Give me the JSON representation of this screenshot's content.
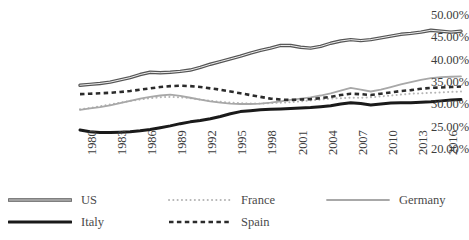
{
  "chart_data": {
    "type": "line",
    "title": "",
    "subtitle": "",
    "xlabel": "",
    "ylabel": "",
    "grid": false,
    "legend_position": "bottom",
    "xlim": [
      1980,
      2018
    ],
    "ylim": [
      0.2,
      0.5
    ],
    "ytick_labels": [
      "50.00%",
      "45.00%",
      "40.00%",
      "35.00%",
      "30.00%",
      "25.00%",
      "20.00%"
    ],
    "ytick_values": [
      0.5,
      0.45,
      0.4,
      0.35,
      0.3,
      0.25,
      0.2
    ],
    "xtick_labels": [
      "1980",
      "1983",
      "1986",
      "1989",
      "1992",
      "1995",
      "1998",
      "2001",
      "2004",
      "2007",
      "2010",
      "2013",
      "2016"
    ],
    "xtick_values": [
      1980,
      1983,
      1986,
      1989,
      1992,
      1995,
      1998,
      2001,
      2004,
      2007,
      2010,
      2013,
      2016
    ],
    "x": [
      1980,
      1981,
      1982,
      1983,
      1984,
      1985,
      1986,
      1987,
      1988,
      1989,
      1990,
      1991,
      1992,
      1993,
      1994,
      1995,
      1996,
      1997,
      1998,
      1999,
      2000,
      2001,
      2002,
      2003,
      2004,
      2005,
      2006,
      2007,
      2008,
      2009,
      2010,
      2011,
      2012,
      2013,
      2014,
      2015,
      2016,
      2017,
      2018
    ],
    "series": [
      {
        "name": "US",
        "style": "solid-double",
        "color": "#555555",
        "width": 1.6,
        "values": [
          0.345,
          0.347,
          0.349,
          0.352,
          0.357,
          0.362,
          0.369,
          0.374,
          0.373,
          0.374,
          0.376,
          0.379,
          0.385,
          0.392,
          0.398,
          0.404,
          0.41,
          0.417,
          0.423,
          0.428,
          0.434,
          0.434,
          0.43,
          0.428,
          0.432,
          0.439,
          0.444,
          0.447,
          0.445,
          0.447,
          0.451,
          0.455,
          0.459,
          0.461,
          0.464,
          0.468,
          0.466,
          0.464,
          0.466
        ]
      },
      {
        "name": "Italy",
        "style": "solid-bold",
        "color": "#1a1a1a",
        "width": 3.0,
        "values": [
          0.245,
          0.241,
          0.239,
          0.239,
          0.24,
          0.241,
          0.243,
          0.246,
          0.25,
          0.254,
          0.259,
          0.263,
          0.266,
          0.27,
          0.275,
          0.281,
          0.286,
          0.288,
          0.29,
          0.291,
          0.292,
          0.293,
          0.294,
          0.295,
          0.297,
          0.299,
          0.303,
          0.306,
          0.304,
          0.301,
          0.303,
          0.305,
          0.306,
          0.306,
          0.307,
          0.308,
          0.31,
          0.312,
          0.313
        ]
      },
      {
        "name": "France",
        "style": "dotted",
        "color": "#b5b5b5",
        "width": 2.0,
        "values": [
          0.291,
          0.294,
          0.298,
          0.302,
          0.306,
          0.31,
          0.313,
          0.316,
          0.318,
          0.319,
          0.318,
          0.316,
          0.313,
          0.31,
          0.308,
          0.306,
          0.305,
          0.304,
          0.304,
          0.305,
          0.306,
          0.307,
          0.309,
          0.311,
          0.313,
          0.315,
          0.316,
          0.317,
          0.317,
          0.318,
          0.32,
          0.322,
          0.324,
          0.326,
          0.327,
          0.328,
          0.329,
          0.33,
          0.331
        ]
      },
      {
        "name": "Germany",
        "style": "solid-light",
        "color": "#a8a8a8",
        "width": 1.8,
        "values": [
          0.29,
          0.293,
          0.296,
          0.3,
          0.305,
          0.31,
          0.315,
          0.319,
          0.322,
          0.324,
          0.321,
          0.317,
          0.313,
          0.309,
          0.306,
          0.304,
          0.303,
          0.303,
          0.304,
          0.306,
          0.309,
          0.312,
          0.315,
          0.318,
          0.322,
          0.327,
          0.333,
          0.339,
          0.335,
          0.331,
          0.335,
          0.341,
          0.347,
          0.352,
          0.357,
          0.361,
          0.363,
          0.364,
          0.365
        ]
      },
      {
        "name": "Spain",
        "style": "dashed",
        "color": "#2b2b2b",
        "width": 2.6,
        "values": [
          0.325,
          0.326,
          0.327,
          0.328,
          0.33,
          0.332,
          0.335,
          0.338,
          0.341,
          0.343,
          0.344,
          0.343,
          0.341,
          0.338,
          0.335,
          0.331,
          0.327,
          0.323,
          0.319,
          0.315,
          0.313,
          0.312,
          0.313,
          0.314,
          0.316,
          0.319,
          0.323,
          0.326,
          0.325,
          0.323,
          0.326,
          0.329,
          0.332,
          0.334,
          0.337,
          0.339,
          0.34,
          0.341,
          0.342
        ]
      }
    ],
    "legend": [
      {
        "label": "US",
        "style": "solid-double",
        "color": "#555555"
      },
      {
        "label": "France",
        "style": "dotted",
        "color": "#b5b5b5"
      },
      {
        "label": "Germany",
        "style": "solid-light",
        "color": "#a8a8a8"
      },
      {
        "label": "Italy",
        "style": "solid-bold",
        "color": "#1a1a1a"
      },
      {
        "label": "Spain",
        "style": "dashed",
        "color": "#2b2b2b"
      }
    ]
  }
}
